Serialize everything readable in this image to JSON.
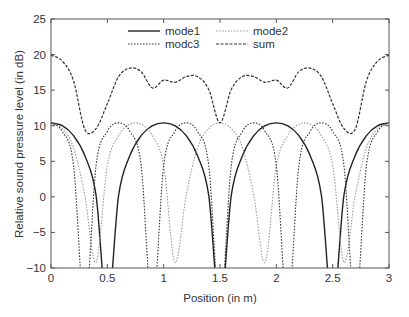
{
  "chart_data": {
    "type": "line",
    "title": "",
    "xlabel": "Position (in m)",
    "ylabel": "Relative sound pressure level (in dB)",
    "xlim": [
      0,
      3
    ],
    "ylim": [
      -10,
      25
    ],
    "xticks": [
      0,
      0.5,
      1,
      1.5,
      2,
      2.5,
      3
    ],
    "xtick_labels": [
      "0",
      "0.5",
      "1",
      "1.5",
      "2",
      "2.5",
      "3"
    ],
    "yticks": [
      -10,
      -5,
      0,
      5,
      10,
      15,
      20,
      25
    ],
    "ytick_labels": [
      "−10",
      "−5",
      "0",
      "5",
      "10",
      "15",
      "20",
      "25"
    ],
    "grid": false,
    "legend_position": "upper center, inside plot, 2 columns",
    "x": [
      0,
      0.1,
      0.2,
      0.3,
      0.4,
      0.5,
      0.6,
      0.7,
      0.8,
      0.9,
      1.0,
      1.1,
      1.2,
      1.3,
      1.4,
      1.5,
      1.6,
      1.7,
      1.8,
      1.9,
      2.0,
      2.1,
      2.2,
      2.3,
      2.4,
      2.5,
      2.6,
      2.7,
      2.8,
      2.9,
      3.0
    ],
    "series": [
      {
        "name": "mode1",
        "style": "solid",
        "color": "#222222",
        "values": [
          10.4,
          10.0,
          8.6,
          5.8,
          0.2,
          -10,
          0.2,
          5.8,
          8.6,
          10.0,
          10.4,
          10.0,
          8.6,
          5.8,
          0.2,
          -10,
          0.2,
          5.8,
          8.6,
          10.0,
          10.4,
          10.0,
          8.6,
          5.8,
          0.2,
          -10,
          0.2,
          5.8,
          8.6,
          10.0,
          10.4
        ]
      },
      {
        "name": "mode2",
        "style": "dotted-light",
        "color": "#9a9a9a",
        "values": [
          10.4,
          9.6,
          6.9,
          0.2,
          -9.2,
          4.4,
          8.6,
          10.2,
          10.2,
          8.6,
          4.4,
          -9.2,
          0.2,
          6.9,
          9.6,
          10.4,
          9.6,
          6.9,
          0.2,
          -9.2,
          4.4,
          8.6,
          10.2,
          10.2,
          8.6,
          4.4,
          -9.2,
          0.2,
          6.9,
          9.6,
          10.4
        ]
      },
      {
        "name": "modc3",
        "style": "dotted",
        "color": "#333333",
        "values": [
          10.4,
          9.2,
          4.4,
          -10,
          4.4,
          9.2,
          10.4,
          9.2,
          4.4,
          -10,
          4.4,
          9.2,
          10.4,
          9.2,
          4.4,
          -10,
          4.4,
          9.2,
          10.4,
          9.2,
          4.4,
          -10,
          4.4,
          9.2,
          10.4,
          9.2,
          4.4,
          -10,
          4.4,
          9.2,
          10.4
        ]
      },
      {
        "name": "sum",
        "style": "dashed",
        "color": "#333333",
        "values": [
          19.9,
          19.1,
          16.3,
          9.5,
          9.6,
          13.1,
          16.9,
          18.1,
          17.6,
          15.3,
          16.4,
          16.1,
          16.9,
          16.9,
          15.1,
          10.4,
          15.1,
          16.9,
          16.9,
          16.1,
          16.4,
          15.3,
          17.6,
          18.1,
          16.9,
          13.1,
          9.6,
          9.5,
          16.3,
          19.1,
          19.9
        ]
      }
    ],
    "legend": [
      "mode1",
      "mode2",
      "modc3",
      "sum"
    ]
  }
}
